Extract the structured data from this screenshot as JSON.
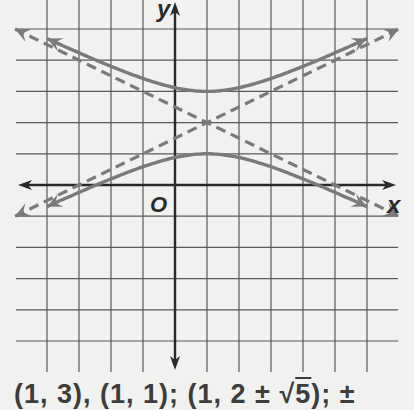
{
  "chart_data": {
    "type": "line",
    "title": "",
    "xlabel": "x",
    "ylabel": "y",
    "origin_label": "O",
    "xlim": [
      -4,
      6
    ],
    "ylim": [
      -5,
      5
    ],
    "grid": true,
    "grid_step": 1,
    "equation": "(y-2)^2 - (x-1)^2/4 = 1",
    "center": [
      1,
      2
    ],
    "vertices": [
      [
        1,
        3
      ],
      [
        1,
        1
      ]
    ],
    "foci": [
      [
        1,
        4.236
      ],
      [
        1,
        -0.236
      ]
    ],
    "series": [
      {
        "name": "hyperbola upper branch",
        "style": "solid",
        "x": [
          -4,
          -3,
          -2,
          -1,
          0,
          1,
          2,
          3,
          4,
          5,
          6
        ],
        "y": [
          4.69,
          4.24,
          3.8,
          3.41,
          3.12,
          3.0,
          3.12,
          3.41,
          3.8,
          4.24,
          4.69
        ]
      },
      {
        "name": "hyperbola lower branch",
        "style": "solid",
        "x": [
          -4,
          -3,
          -2,
          -1,
          0,
          1,
          2,
          3,
          4,
          5,
          6
        ],
        "y": [
          -0.69,
          -0.24,
          0.2,
          0.59,
          0.88,
          1.0,
          0.88,
          0.59,
          0.2,
          -0.24,
          -0.69
        ]
      },
      {
        "name": "asymptote y = 0.5x + 1.5",
        "style": "dashed",
        "x": [
          -5,
          7
        ],
        "y": [
          -1,
          5
        ]
      },
      {
        "name": "asymptote y = -0.5x + 2.5",
        "style": "dashed",
        "x": [
          -5,
          7
        ],
        "y": [
          5,
          -1
        ]
      }
    ],
    "colors": {
      "curve": "#7a7a7a",
      "axis": "#2a2a2a",
      "grid": "#5a5a5a",
      "background": "#f1f1ef"
    }
  },
  "answer": {
    "part1": "(1, 3), (1, 1); (1, 2 ± ",
    "radical": "5",
    "part2": "); ±"
  }
}
